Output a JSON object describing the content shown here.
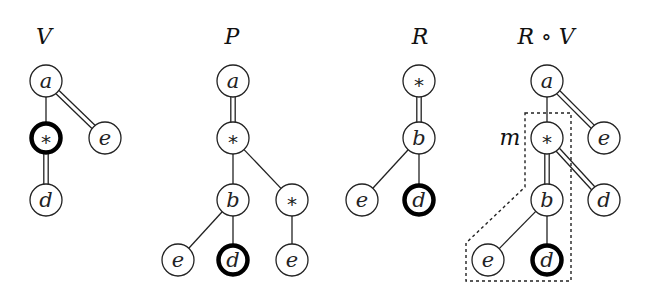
{
  "figure": {
    "trees": [
      {
        "id": "V",
        "title": "V",
        "title_pos": [
          44,
          44
        ],
        "nodes": [
          {
            "id": "a",
            "label": "a",
            "x": 46,
            "y": 81,
            "bold": false
          },
          {
            "id": "s",
            "label": "*",
            "x": 46,
            "y": 138,
            "bold": true
          },
          {
            "id": "e",
            "label": "e",
            "x": 105,
            "y": 138,
            "bold": false
          },
          {
            "id": "d",
            "label": "d",
            "x": 46,
            "y": 200,
            "bold": false
          }
        ],
        "edges": [
          {
            "from": "a",
            "to": "s",
            "type": "single"
          },
          {
            "from": "a",
            "to": "e",
            "type": "double"
          },
          {
            "from": "s",
            "to": "d",
            "type": "double"
          }
        ]
      },
      {
        "id": "P",
        "title": "P",
        "title_pos": [
          232,
          44
        ],
        "nodes": [
          {
            "id": "a",
            "label": "a",
            "x": 233,
            "y": 81,
            "bold": false
          },
          {
            "id": "s1",
            "label": "*",
            "x": 233,
            "y": 138,
            "bold": false
          },
          {
            "id": "b",
            "label": "b",
            "x": 233,
            "y": 200,
            "bold": false
          },
          {
            "id": "s2",
            "label": "*",
            "x": 292,
            "y": 200,
            "bold": false
          },
          {
            "id": "e1",
            "label": "e",
            "x": 178,
            "y": 260,
            "bold": false
          },
          {
            "id": "d",
            "label": "d",
            "x": 233,
            "y": 260,
            "bold": true
          },
          {
            "id": "e2",
            "label": "e",
            "x": 292,
            "y": 260,
            "bold": false
          }
        ],
        "edges": [
          {
            "from": "a",
            "to": "s1",
            "type": "double"
          },
          {
            "from": "s1",
            "to": "b",
            "type": "single"
          },
          {
            "from": "s1",
            "to": "s2",
            "type": "single"
          },
          {
            "from": "b",
            "to": "e1",
            "type": "single"
          },
          {
            "from": "b",
            "to": "d",
            "type": "single"
          },
          {
            "from": "s2",
            "to": "e2",
            "type": "single"
          }
        ]
      },
      {
        "id": "R",
        "title": "R",
        "title_pos": [
          420,
          44
        ],
        "nodes": [
          {
            "id": "s",
            "label": "*",
            "x": 419,
            "y": 81,
            "bold": false
          },
          {
            "id": "b",
            "label": "b",
            "x": 419,
            "y": 138,
            "bold": false
          },
          {
            "id": "e",
            "label": "e",
            "x": 362,
            "y": 200,
            "bold": false
          },
          {
            "id": "d",
            "label": "d",
            "x": 419,
            "y": 200,
            "bold": true
          }
        ],
        "edges": [
          {
            "from": "s",
            "to": "b",
            "type": "double"
          },
          {
            "from": "b",
            "to": "e",
            "type": "single"
          },
          {
            "from": "b",
            "to": "d",
            "type": "single"
          }
        ]
      },
      {
        "id": "RoV",
        "title": "R ∘ V",
        "title_pos": [
          546,
          44
        ],
        "nodes": [
          {
            "id": "a",
            "label": "a",
            "x": 547,
            "y": 81,
            "bold": false
          },
          {
            "id": "s",
            "label": "*",
            "x": 547,
            "y": 138,
            "bold": false
          },
          {
            "id": "e1",
            "label": "e",
            "x": 604,
            "y": 138,
            "bold": false
          },
          {
            "id": "b",
            "label": "b",
            "x": 547,
            "y": 200,
            "bold": false
          },
          {
            "id": "d1",
            "label": "d",
            "x": 604,
            "y": 200,
            "bold": false
          },
          {
            "id": "e2",
            "label": "e",
            "x": 488,
            "y": 260,
            "bold": false
          },
          {
            "id": "d2",
            "label": "d",
            "x": 547,
            "y": 260,
            "bold": true
          }
        ],
        "edges": [
          {
            "from": "a",
            "to": "s",
            "type": "single"
          },
          {
            "from": "a",
            "to": "e1",
            "type": "double"
          },
          {
            "from": "s",
            "to": "b",
            "type": "double"
          },
          {
            "from": "s",
            "to": "d1",
            "type": "double"
          },
          {
            "from": "b",
            "to": "e2",
            "type": "single"
          },
          {
            "from": "b",
            "to": "d2",
            "type": "single"
          }
        ],
        "annotation": {
          "label": "m",
          "label_pos": [
            510,
            145
          ],
          "dashed_region": [
            [
              525,
              113
            ],
            [
              571,
              113
            ],
            [
              571,
              281
            ],
            [
              466,
              281
            ],
            [
              466,
              243
            ],
            [
              525,
              187
            ]
          ]
        }
      }
    ],
    "node_radius": 16
  }
}
